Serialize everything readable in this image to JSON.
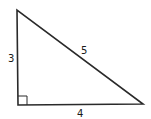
{
  "diagram": {
    "type": "right-triangle",
    "stroke_color": "#2a2a2a",
    "vertices": {
      "top_left": [
        17,
        10
      ],
      "bottom_left": [
        18,
        105
      ],
      "bottom_right": [
        143,
        104
      ]
    },
    "labels": {
      "vertical_leg": "3",
      "hypotenuse": "5",
      "horizontal_leg": "4"
    },
    "right_angle_marker": true
  }
}
